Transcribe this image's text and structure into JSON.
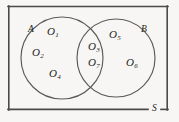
{
  "figure": {
    "name": "venn-diagram-two-sets",
    "background_color": "#f7f6f4",
    "ink_color": "#231f20",
    "stroke_color": "#4a4a4a",
    "universal_set_label": "S",
    "set_labels": {
      "left": "A",
      "right": "B"
    },
    "elements": [
      {
        "id": "o1",
        "label": "O",
        "subscript": "1",
        "region": "A-only",
        "x": 47,
        "y": 26
      },
      {
        "id": "o2",
        "label": "O",
        "subscript": "2",
        "region": "A-only",
        "x": 32,
        "y": 47
      },
      {
        "id": "o3",
        "label": "O",
        "subscript": "3",
        "region": "A-intersect-B",
        "x": 88,
        "y": 41
      },
      {
        "id": "o4",
        "label": "O",
        "subscript": "4",
        "region": "A-only",
        "x": 49,
        "y": 68
      },
      {
        "id": "o5",
        "label": "O",
        "subscript": "5",
        "region": "B-only",
        "x": 109,
        "y": 29
      },
      {
        "id": "o6",
        "label": "O",
        "subscript": "6",
        "region": "B-only",
        "x": 126,
        "y": 57
      },
      {
        "id": "o7",
        "label": "O",
        "subscript": "7",
        "region": "A-intersect-B",
        "x": 88,
        "y": 57
      }
    ],
    "set_label_positions": {
      "A": {
        "x": 28,
        "y": 25
      },
      "B": {
        "x": 141,
        "y": 25
      },
      "S": {
        "x": 152,
        "y": 104
      }
    },
    "geometry": {
      "rectangle": {
        "x": 8,
        "y": 6,
        "width": 160,
        "height": 104
      },
      "circle_left": {
        "cx": 62,
        "cy": 58,
        "r": 41
      },
      "circle_right": {
        "cx": 116,
        "cy": 58,
        "r": 39
      }
    }
  }
}
